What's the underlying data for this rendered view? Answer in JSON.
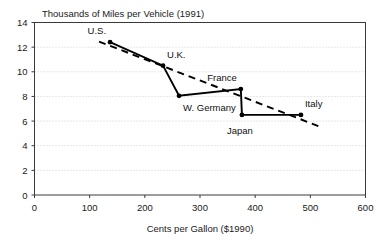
{
  "chart_data": {
    "type": "line",
    "title": "Thousands of Miles per Vehicle (1991)",
    "xlabel": "Cents per Gallon ($1990)",
    "ylabel": "",
    "xlim": [
      0,
      600
    ],
    "ylim": [
      0,
      14
    ],
    "xticks": [
      0,
      100,
      200,
      300,
      400,
      500,
      600
    ],
    "yticks": [
      0,
      2,
      4,
      6,
      8,
      10,
      12,
      14
    ],
    "grid": "horizontal-dotted",
    "legend": "none",
    "series": [
      {
        "name": "Country data",
        "style": "solid",
        "points": [
          {
            "label": "U.S.",
            "x": 137,
            "y": 12.4
          },
          {
            "label": "U.K.",
            "x": 233,
            "y": 10.5
          },
          {
            "label": "W. Germany",
            "x": 262,
            "y": 8.05
          },
          {
            "label": "France",
            "x": 374,
            "y": 8.6
          },
          {
            "label": "Japan",
            "x": 376,
            "y": 6.5
          },
          {
            "label": "Italy",
            "x": 483,
            "y": 6.5
          }
        ]
      },
      {
        "name": "Trend",
        "style": "dashed",
        "points": [
          {
            "label": "",
            "x": 117,
            "y": 12.45
          },
          {
            "label": "",
            "x": 517,
            "y": 5.55
          }
        ]
      }
    ],
    "annotations": [
      {
        "text": "U.S.",
        "x": 137,
        "y": 12.4,
        "placement": "above-left"
      },
      {
        "text": "U.K.",
        "x": 233,
        "y": 10.5,
        "placement": "above-right"
      },
      {
        "text": "W. Germany",
        "x": 262,
        "y": 8.05,
        "placement": "below-right"
      },
      {
        "text": "France",
        "x": 374,
        "y": 8.6,
        "placement": "above-left"
      },
      {
        "text": "Japan",
        "x": 376,
        "y": 6.5,
        "placement": "below"
      },
      {
        "text": "Italy",
        "x": 483,
        "y": 6.5,
        "placement": "above-right"
      }
    ],
    "ticklabels": {
      "x": [
        "0",
        "100",
        "200",
        "300",
        "400",
        "500",
        "600"
      ],
      "y": [
        "0",
        "2",
        "4",
        "6",
        "8",
        "10",
        "12",
        "14"
      ]
    }
  }
}
